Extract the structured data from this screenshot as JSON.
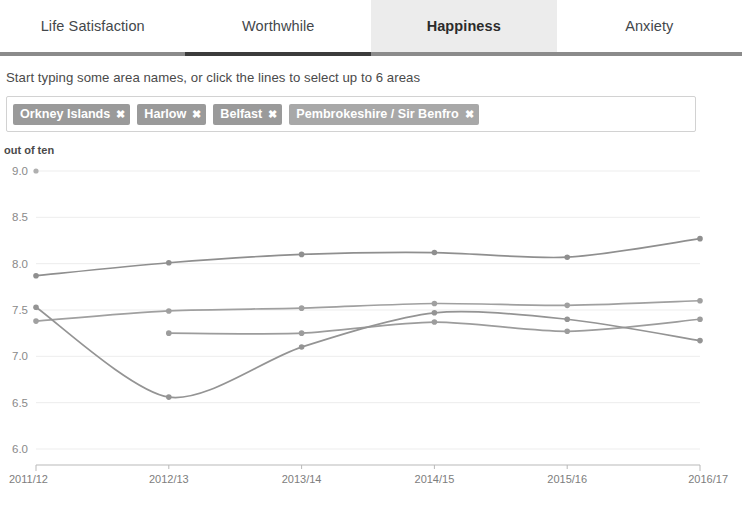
{
  "tabs": [
    {
      "label": "Life Satisfaction",
      "active": false
    },
    {
      "label": "Worthwhile",
      "active": false
    },
    {
      "label": "Happiness",
      "active": true
    },
    {
      "label": "Anxiety",
      "active": false
    }
  ],
  "instruction": "Start typing some area names, or click the lines to select up to 6 areas",
  "selection": {
    "chips": [
      {
        "label": "Orkney Islands",
        "remove": "✖",
        "color": "#9a9a9a"
      },
      {
        "label": "Harlow",
        "remove": "✖",
        "color": "#9a9a9a"
      },
      {
        "label": "Belfast",
        "remove": "✖",
        "color": "#9a9a9a"
      },
      {
        "label": "Pembrokeshire / Sir Benfro",
        "remove": "✖",
        "color": "#a8a8a8"
      }
    ]
  },
  "chart_data": {
    "type": "line",
    "title": "",
    "xlabel": "",
    "ylabel": "out of ten",
    "ylim": [
      6.0,
      9.0
    ],
    "yticks": [
      9.0,
      8.5,
      8.0,
      7.5,
      7.0,
      6.5,
      6.0
    ],
    "ytick_labels": [
      "9.0",
      "8.5",
      "8.0",
      "7.5",
      "7.0",
      "6.5",
      "6.0"
    ],
    "grid": true,
    "legend": "none",
    "categories": [
      "2011/12",
      "2012/13",
      "2013/14",
      "2014/15",
      "2015/16",
      "2016/17"
    ],
    "x": [
      "2011/12",
      "2012/13",
      "2013/14",
      "2014/15",
      "2015/16",
      "2016/17"
    ],
    "series": [
      {
        "name": "Orkney Islands",
        "color": "#8f8f8f",
        "values": [
          7.87,
          8.01,
          8.1,
          8.12,
          8.07,
          8.27
        ]
      },
      {
        "name": "Harlow",
        "color": "#a0a0a0",
        "values": [
          7.38,
          7.49,
          7.52,
          7.57,
          7.55,
          7.6
        ]
      },
      {
        "name": "Belfast",
        "color": "#9c9c9c",
        "values": [
          null,
          7.25,
          7.25,
          7.37,
          7.27,
          7.4
        ]
      },
      {
        "name": "Pembrokeshire / Sir Benfro",
        "color": "#949494",
        "values": [
          7.53,
          6.56,
          7.1,
          7.47,
          7.4,
          7.17
        ]
      }
    ],
    "marker_point": {
      "value": 9.0,
      "x_index": 0,
      "color": "#b0b0b0"
    }
  }
}
